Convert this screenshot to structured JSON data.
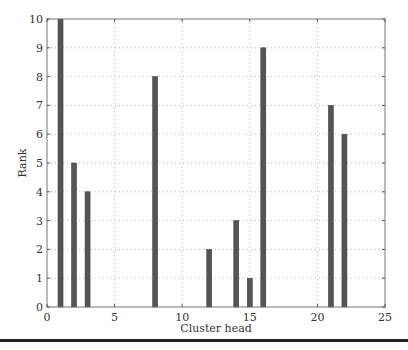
{
  "chart_data": {
    "type": "bar",
    "title": "",
    "xlabel": "Cluster head",
    "ylabel": "Rank",
    "x": [
      1,
      2,
      3,
      8,
      12,
      14,
      15,
      16,
      21,
      22
    ],
    "values": [
      10,
      5,
      4,
      8,
      2,
      3,
      1,
      9,
      7,
      6
    ],
    "xlim": [
      0,
      25
    ],
    "ylim": [
      0,
      10
    ],
    "xticks": [
      0,
      5,
      10,
      15,
      20,
      25
    ],
    "yticks": [
      0,
      1,
      2,
      3,
      4,
      5,
      6,
      7,
      8,
      9,
      10
    ],
    "grid": true,
    "legend": null,
    "bar_color": "#555555"
  }
}
